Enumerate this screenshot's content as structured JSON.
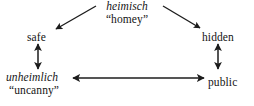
{
  "diagram": {
    "type": "semantic-relationship-triangle",
    "nodes": {
      "heimisch": {
        "term": "heimisch",
        "gloss": "“homey”",
        "position": "top-center"
      },
      "safe": {
        "label": "safe",
        "position": "upper-left"
      },
      "hidden": {
        "label": "hidden",
        "position": "upper-right"
      },
      "unheimlich": {
        "term": "unheimlich",
        "gloss": "“uncanny”",
        "position": "lower-left"
      },
      "public": {
        "label": "public",
        "position": "lower-right"
      }
    },
    "edges": [
      {
        "id": "heimisch-to-safe",
        "from": "heimisch",
        "to": "safe",
        "style": "single-headed",
        "orientation": "diagonal-down-left"
      },
      {
        "id": "heimisch-to-hidden",
        "from": "heimisch",
        "to": "hidden",
        "style": "single-headed",
        "orientation": "diagonal-down-right"
      },
      {
        "id": "safe-to-unheimlich",
        "from": "safe",
        "to": "unheimlich",
        "style": "double-headed",
        "orientation": "vertical"
      },
      {
        "id": "hidden-to-public",
        "from": "hidden",
        "to": "public",
        "style": "double-headed",
        "orientation": "vertical"
      },
      {
        "id": "unheimlich-to-public",
        "from": "unheimlich",
        "to": "public",
        "style": "double-headed",
        "orientation": "horizontal"
      }
    ],
    "colors": {
      "background": "#ffffff",
      "text": "#141414",
      "stroke": "#1c1c1c"
    }
  }
}
